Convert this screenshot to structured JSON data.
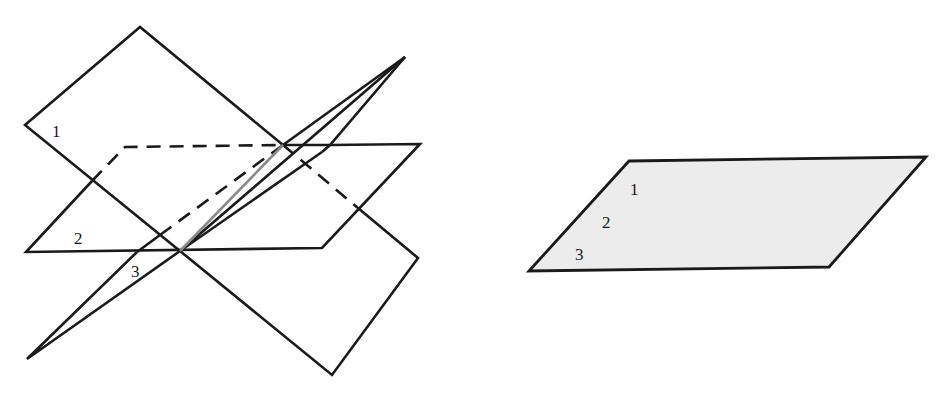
{
  "left_figure": {
    "description": "Three planes intersecting in a common line",
    "labels": {
      "plane1": "1",
      "plane2": "2",
      "plane3": "3"
    },
    "colors": {
      "stroke": "#1a1a1a",
      "intersection_line": "#8a8a8a"
    }
  },
  "right_figure": {
    "description": "Three coincident planes drawn as a single shaded plane",
    "labels": {
      "plane1": "1",
      "plane2": "2",
      "plane3": "3"
    },
    "colors": {
      "stroke": "#1a1a1a",
      "fill": "#ececec"
    }
  }
}
